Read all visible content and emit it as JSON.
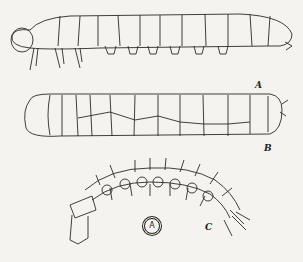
{
  "figure": {
    "labels": {
      "a": "A",
      "b": "B",
      "c": "C"
    },
    "circle_mark": "A",
    "background": "#f4f3ef",
    "ink": "#222222",
    "panels": [
      {
        "id": "A",
        "description": "caterpillar-like larva with thoracic legs and abdominal prolegs, lateral view"
      },
      {
        "id": "B",
        "description": "segmented grub-like larva, lateral view"
      },
      {
        "id": "C",
        "description": "slender bristled larva curved, with head capsule at left"
      }
    ]
  }
}
